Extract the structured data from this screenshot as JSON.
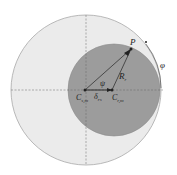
{
  "diagram": {
    "outer_circle": {
      "cx": 86,
      "cy": 90,
      "r": 75,
      "fill": "#e9e9e9",
      "stroke": "#a8a8a8"
    },
    "inner_circle": {
      "cx": 114,
      "cy": 90,
      "r": 46,
      "fill": "#9a9a9a",
      "stroke": "#8a8a8a"
    },
    "axes": {
      "h_y": 90,
      "v_x": 86
    },
    "points": {
      "Cs": {
        "x": 85,
        "y": 90
      },
      "Cr": {
        "x": 112,
        "y": 90
      },
      "P": {
        "x": 131,
        "y": 49
      }
    },
    "labels": {
      "P": "P",
      "Rr": "R",
      "Rr_sub": "r",
      "psi": "ψ",
      "phi": "φ",
      "Cs": "C",
      "Cs_sub": "s,m",
      "delta": "δ",
      "delta_sub": "rs",
      "Cr": "C",
      "Cr_sub": "r,m"
    }
  }
}
